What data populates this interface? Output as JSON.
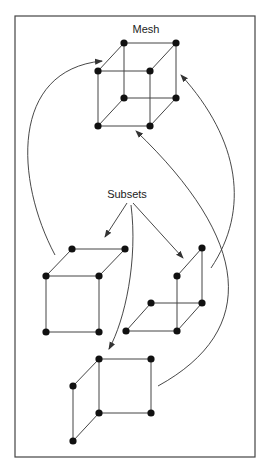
{
  "labels": {
    "mesh": "Mesh",
    "subsets": "Subsets"
  },
  "colors": {
    "stroke": "#333333",
    "node": "#111111",
    "frame": "#444444"
  },
  "diagram": {
    "mesh": {
      "nodes": 8,
      "shape": "cube"
    },
    "subsets": [
      {
        "name": "left-subset",
        "nodes": 6
      },
      {
        "name": "right-subset",
        "nodes": 6
      },
      {
        "name": "bottom-subset",
        "nodes": 6
      }
    ]
  }
}
